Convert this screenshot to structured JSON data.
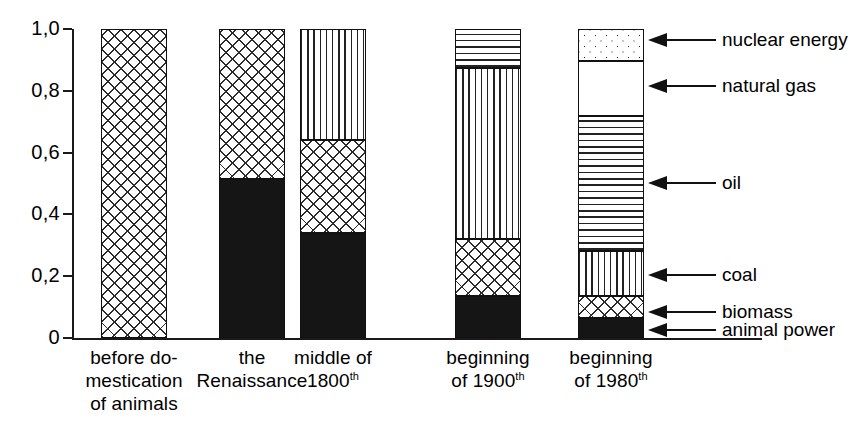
{
  "chart_data": {
    "type": "bar",
    "subtype": "stacked-bar-100-percent",
    "title": "",
    "xlabel": "",
    "ylabel": "",
    "ylim": [
      0,
      1.0
    ],
    "ytick_labels": [
      "0",
      "0,2",
      "0,4",
      "0,6",
      "0,8",
      "1,0"
    ],
    "ytick_values": [
      0,
      0.2,
      0.4,
      0.6,
      0.8,
      1.0
    ],
    "grid": false,
    "legend_position": "right-callouts",
    "decimal_separator": ",",
    "categories": [
      "before do-\nmestication\nof animals",
      "the\nRenaissance",
      "middle of\n1800th",
      "beginning\nof 1900th",
      "beginning\nof 1980th"
    ],
    "category_lines": [
      [
        "before do-",
        "mestication",
        "of animals"
      ],
      [
        "the",
        "Renaissance"
      ],
      [
        "middle of",
        "1800",
        "th"
      ],
      [
        "beginning",
        "of 1900",
        "th"
      ],
      [
        "beginning",
        "of  1980",
        "th"
      ]
    ],
    "series": [
      {
        "name": "animal power",
        "pattern": "solid-black",
        "values": [
          0.0,
          0.515,
          0.34,
          0.135,
          0.065
        ]
      },
      {
        "name": "biomass",
        "pattern": "cross-hatch",
        "values": [
          1.0,
          0.485,
          0.3,
          0.185,
          0.07
        ]
      },
      {
        "name": "coal",
        "pattern": "vertical-lines",
        "values": [
          0.0,
          0.0,
          0.36,
          0.555,
          0.145
        ]
      },
      {
        "name": "oil",
        "pattern": "horizontal-lines",
        "values": [
          0.0,
          0.0,
          0.0,
          0.125,
          0.44
        ]
      },
      {
        "name": "natural gas",
        "pattern": "white-blank",
        "values": [
          0.0,
          0.0,
          0.0,
          0.0,
          0.175
        ]
      },
      {
        "name": "nuclear energy",
        "pattern": "dotted",
        "values": [
          0.0,
          0.0,
          0.0,
          0.0,
          0.105
        ]
      }
    ],
    "cumulative_boundaries": [
      [
        0.0,
        1.0,
        1.0,
        1.0,
        1.0,
        1.0
      ],
      [
        0.515,
        1.0,
        1.0,
        1.0,
        1.0,
        1.0
      ],
      [
        0.34,
        0.64,
        1.0,
        1.0,
        1.0,
        1.0
      ],
      [
        0.135,
        0.32,
        0.875,
        1.0,
        1.0,
        1.0
      ],
      [
        0.065,
        0.135,
        0.28,
        0.72,
        0.895,
        1.0
      ]
    ],
    "callouts": [
      {
        "label": "nuclear energy",
        "y": 40
      },
      {
        "label": "natural gas",
        "y": 86
      },
      {
        "label": "oil",
        "y": 183
      },
      {
        "label": "coal",
        "y": 275
      },
      {
        "label": "biomass",
        "y": 312
      },
      {
        "label": "animal power",
        "y": 330
      }
    ]
  },
  "colors": {
    "ink": "#111111",
    "background": "#ffffff",
    "solid_fill": "#151515"
  }
}
